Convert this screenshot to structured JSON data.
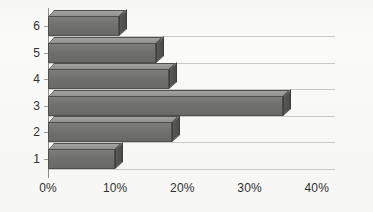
{
  "chart_data": {
    "type": "bar",
    "orientation": "horizontal",
    "title": "",
    "xlabel": "",
    "ylabel": "",
    "categories": [
      "1",
      "2",
      "3",
      "4",
      "5",
      "6"
    ],
    "values": [
      10,
      18.5,
      35,
      18,
      16,
      10.5
    ],
    "value_unit": "%",
    "xlim": [
      0,
      40
    ],
    "xticks": [
      0,
      10,
      20,
      30,
      40
    ],
    "xtick_labels": [
      "0%",
      "10%",
      "20%",
      "30%",
      "40%"
    ],
    "ytick_labels": [
      "6",
      "5",
      "4",
      "3",
      "2",
      "1"
    ],
    "grid": "horizontal",
    "legend": "none",
    "style": "3d-bar",
    "series": [
      {
        "name": "series-1",
        "values": [
          10,
          18.5,
          35,
          18,
          16,
          10.5
        ]
      }
    ],
    "bars_top_to_bottom": [
      {
        "category": "6",
        "value": 10.5
      },
      {
        "category": "5",
        "value": 16
      },
      {
        "category": "4",
        "value": 18
      },
      {
        "category": "3",
        "value": 35
      },
      {
        "category": "2",
        "value": 18.5
      },
      {
        "category": "1",
        "value": 10
      }
    ],
    "colors": {
      "bar_face": "#6f6f6c",
      "bar_top": "#9a9a97",
      "bar_side": "#4f4f4d",
      "gridline": "#c9c9c6",
      "axis": "#8d8d8a",
      "text": "#2f2f2e",
      "background": "#fafaf9"
    }
  }
}
